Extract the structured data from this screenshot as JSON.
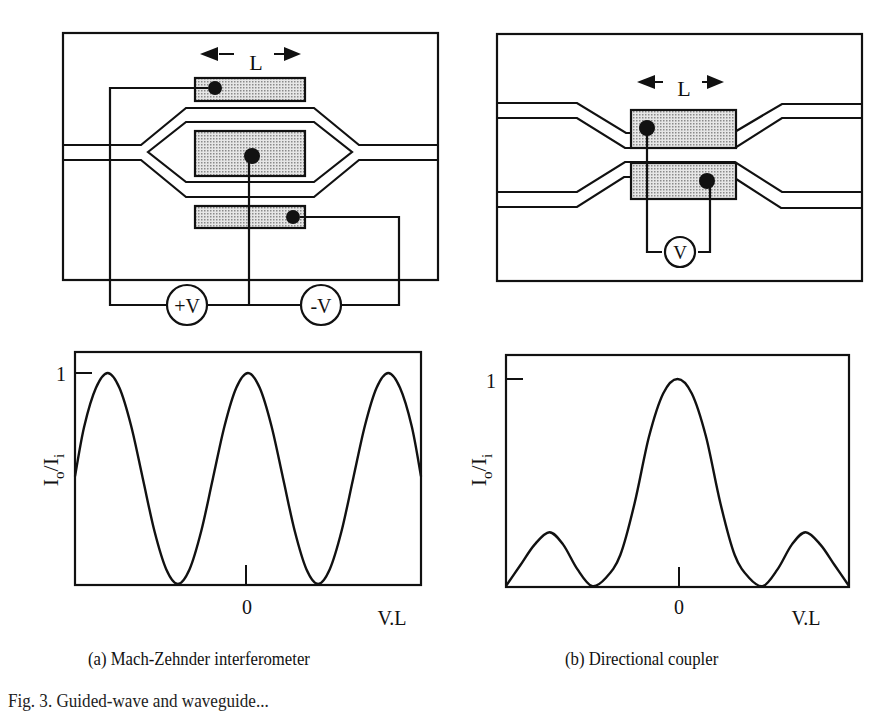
{
  "figure": {
    "panel_a": {
      "caption": "(a)  Mach-Zehnder interferometer",
      "length_label": "L",
      "sources": [
        "+V",
        "-V"
      ]
    },
    "panel_b": {
      "caption": "(b)  Directional coupler",
      "length_label": "L",
      "sources": [
        "V"
      ]
    },
    "figure_caption_partial": "Fig. 3.  Guided-wave and waveguide...",
    "colors": {
      "ink": "#111111",
      "electrode_fill": "#c8c8c8",
      "background": "#ffffff"
    }
  },
  "chart_data": [
    {
      "type": "line",
      "title": "Mach-Zehnder interferometer",
      "xlabel": "V.L",
      "ylabel": "Io/Ii",
      "y_tick_labels": [
        "1"
      ],
      "x_tick_labels": [
        "0"
      ],
      "xlim": [
        -3.7,
        3.7
      ],
      "ylim": [
        0,
        1.1
      ],
      "description": "cos^2 response, period 3 units, peaks at x = -3, 0, 3; minima at x = -1.5, 1.5",
      "series": [
        {
          "name": "Io/Ii",
          "x": [
            -3.7,
            -3.5,
            -3.25,
            -3.0,
            -2.75,
            -2.5,
            -2.25,
            -2.0,
            -1.75,
            -1.5,
            -1.25,
            -1.0,
            -0.75,
            -0.5,
            -0.25,
            0,
            0.25,
            0.5,
            0.75,
            1.0,
            1.25,
            1.5,
            1.75,
            2.0,
            2.25,
            2.5,
            2.75,
            3.0,
            3.25,
            3.5,
            3.7
          ],
          "y": [
            0.51,
            0.75,
            0.93,
            1.0,
            0.93,
            0.75,
            0.5,
            0.25,
            0.07,
            0.0,
            0.07,
            0.25,
            0.5,
            0.75,
            0.93,
            1.0,
            0.93,
            0.75,
            0.5,
            0.25,
            0.07,
            0.0,
            0.07,
            0.25,
            0.5,
            0.75,
            0.93,
            1.0,
            0.93,
            0.75,
            0.51
          ]
        }
      ]
    },
    {
      "type": "line",
      "title": "Directional coupler",
      "xlabel": "V.L",
      "ylabel": "Io/Ii",
      "y_tick_labels": [
        "1"
      ],
      "x_tick_labels": [
        "0"
      ],
      "xlim": [
        -3.0,
        3.0
      ],
      "ylim": [
        0,
        1.1
      ],
      "description": "sinc^2-like response with main lobe at 0 and side lobes of ~0.26 at x = +/-2.24",
      "series": [
        {
          "name": "Io/Ii",
          "x": [
            -3.0,
            -2.75,
            -2.5,
            -2.24,
            -2.0,
            -1.75,
            -1.5,
            -1.25,
            -1.0,
            -0.75,
            -0.5,
            -0.25,
            0,
            0.25,
            0.5,
            0.75,
            1.0,
            1.25,
            1.5,
            1.75,
            2.0,
            2.24,
            2.5,
            2.75,
            3.0
          ],
          "y": [
            0.0,
            0.1,
            0.2,
            0.26,
            0.2,
            0.08,
            0.0,
            0.04,
            0.15,
            0.4,
            0.72,
            0.93,
            1.0,
            0.93,
            0.72,
            0.4,
            0.15,
            0.04,
            0.0,
            0.08,
            0.2,
            0.26,
            0.2,
            0.1,
            0.0
          ]
        }
      ]
    }
  ]
}
